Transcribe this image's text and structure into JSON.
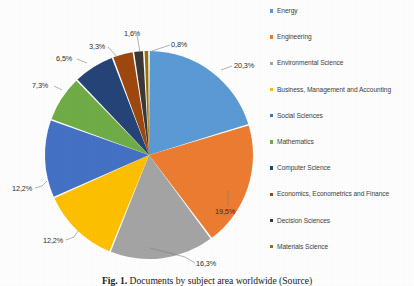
{
  "chart_data": {
    "type": "pie",
    "title": "",
    "categories": [
      "Energy",
      "Engineering",
      "Environmental Science",
      "Business, Management and Accounting",
      "Social Sciences",
      "Mathematics",
      "Computer Science",
      "Economics, Econometrics and Finance",
      "Decision Sciences",
      "Materials Science"
    ],
    "values": [
      20.3,
      19.5,
      16.3,
      12.2,
      12.2,
      7.3,
      6.5,
      3.3,
      1.6,
      0.8
    ],
    "data_labels": [
      "20,3%",
      "19,5%",
      "16,3%",
      "12,2%",
      "12,2%",
      "7,3%",
      "6,5%",
      "3,3%",
      "1,6%",
      "0,8%"
    ],
    "colors": [
      "#5B9BD5",
      "#ED7D31",
      "#A5A5A5",
      "#FFC000",
      "#4472C4",
      "#70AD47",
      "#264478",
      "#9E480E",
      "#3A3838",
      "#997300"
    ],
    "unit": "percent",
    "legend_position": "right",
    "grid": false,
    "xlabel": "",
    "ylabel": ""
  },
  "legend": {
    "items": [
      {
        "label": "Energy",
        "color": "#5B9BD5"
      },
      {
        "label": "Engineering",
        "color": "#ED7D31"
      },
      {
        "label": "Environmental Science",
        "color": "#A5A5A5"
      },
      {
        "label": "Business, Management and Accounting",
        "color": "#FFC000"
      },
      {
        "label": "Social Sciences",
        "color": "#4472C4"
      },
      {
        "label": "Mathematics",
        "color": "#70AD47"
      },
      {
        "label": "Computer Science",
        "color": "#264478"
      },
      {
        "label": "Economics, Econometrics and Finance",
        "color": "#9E480E"
      },
      {
        "label": "Decision Sciences",
        "color": "#3A3838"
      },
      {
        "label": "Materials Science",
        "color": "#997300"
      }
    ]
  },
  "labels": {
    "energy": "20,3%",
    "engineering": "19,5%",
    "environmental_science": "16,3%",
    "business": "12,2%",
    "social_sciences": "12,2%",
    "mathematics": "7,3%",
    "computer_science": "6,5%",
    "economics": "3,3%",
    "decision_sciences": "1,6%",
    "materials_science": "0,8%"
  },
  "caption": {
    "prefix": "Fig. 1.",
    "text": "Documents by subject area worldwide (Source)"
  }
}
